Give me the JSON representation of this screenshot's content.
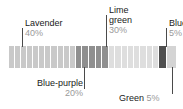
{
  "chart_data": {
    "type": "bar",
    "orientation": "horizontal",
    "stacked": true,
    "title": "",
    "subtitle": "",
    "xlabel": "",
    "ylabel": "",
    "grid": false,
    "legend_position": "callout-annotations",
    "total": 100,
    "unit": "%",
    "categories": [
      "Lavender",
      "Blue-purple",
      "Lime green",
      "Blue",
      "Green"
    ],
    "values": [
      40,
      20,
      30,
      5,
      5
    ],
    "series": [
      {
        "name": "Color distribution",
        "values": [
          40,
          20,
          30,
          5,
          5
        ]
      }
    ],
    "segments": [
      {
        "name": "Lavender",
        "value": 40,
        "value_label": "40%",
        "fill": "#c9c9c9",
        "strips": 11,
        "label_id": "label-lavender",
        "leader_direction": "down"
      },
      {
        "name": "Blue-purple",
        "value": 20,
        "value_label": "20%",
        "fill": "#8f8f8f",
        "strips": 5,
        "label_id": "label-bluepurple",
        "leader_direction": "up"
      },
      {
        "name": "Lime green",
        "value": 30,
        "value_label": "30%",
        "fill": "#dedede",
        "strips": 8,
        "label_id": "label-limegreen",
        "leader_direction": "down"
      },
      {
        "name": "Blue",
        "value": 5,
        "value_label": "5%",
        "fill": "#4f4f4f",
        "strips": 1,
        "label_id": "label-blue",
        "leader_direction": "down"
      },
      {
        "name": "Green",
        "value": 5,
        "value_label": "5%",
        "fill": "#d4d4d4",
        "strips": 1,
        "label_id": "label-green",
        "leader_direction": "up"
      }
    ],
    "annotations": [
      {
        "name": "Lavender",
        "value_label": "40%",
        "layout": "stacked"
      },
      {
        "name": "Lime green",
        "value_label": "30%",
        "layout": "stacked"
      },
      {
        "name": "Blue",
        "value_label": "5%",
        "layout": "stacked"
      },
      {
        "name": "Blue-purple",
        "value_label": "20%",
        "layout": "stacked-right"
      },
      {
        "name": "Green",
        "value_label": "5%",
        "layout": "inline"
      }
    ]
  },
  "labels": {
    "lavender": {
      "name": "Lavender",
      "pct": "40%"
    },
    "limegreen": {
      "name_line1": "Lime",
      "name_line2": "green",
      "pct": "30%"
    },
    "blue": {
      "name": "Blue",
      "pct": "5%"
    },
    "bluepurple": {
      "name": "Blue-purple",
      "pct": "20%"
    },
    "green": {
      "name": "Green",
      "pct": "5%"
    }
  },
  "colors": {
    "lavender": "#c9c9c9",
    "bluepurple": "#8f8f8f",
    "limegreen": "#dedede",
    "blue": "#4f4f4f",
    "green": "#d4d4d4",
    "leader": "#4a4a4a",
    "text": "#1a1a1a",
    "pct_text": "#9a9a9a",
    "background": "#ffffff"
  }
}
